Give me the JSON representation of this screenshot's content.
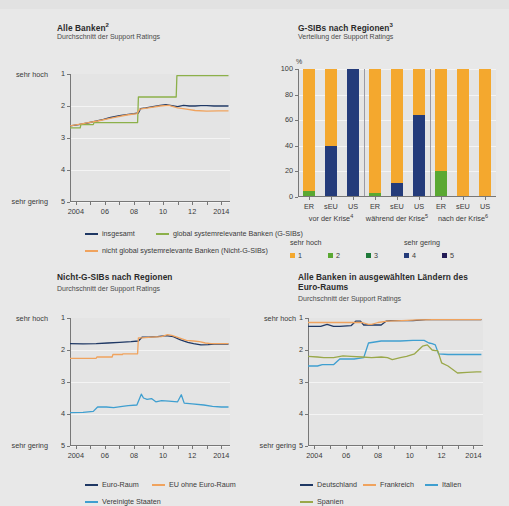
{
  "figure": {
    "background": "#e8e8e8",
    "palette": {
      "navy": "#1f3864",
      "green": "#8cb04a",
      "orange_line": "#f0a35e",
      "blue_light": "#3f9fd0",
      "olive": "#9aa84a",
      "bar_orange": "#f4a82e",
      "bar_green_light": "#5aa832",
      "bar_green_dark": "#1f7a3a",
      "bar_blue": "#243b7a",
      "bar_navy": "#221a55"
    }
  },
  "panel1": {
    "title": "Alle Banken",
    "title_sup": "2",
    "subtitle": "Durchschnitt der Support Ratings",
    "axis": {
      "y_top_label": "sehr hoch",
      "y_bottom_label": "sehr gering",
      "y_ticks": [
        "1",
        "2",
        "3",
        "4",
        "5"
      ],
      "x_ticks": [
        "2004",
        "06",
        "08",
        "10",
        "12",
        "2014"
      ]
    },
    "legend": [
      {
        "label": "insgesamt",
        "color": "#1f3864"
      },
      {
        "label": "global systemrelevante Banken (G-SIBs)",
        "color": "#8cb04a"
      },
      {
        "label": "nicht global systemrelevante Banken (Nicht-G-SIBs)",
        "color": "#f0a35e"
      }
    ]
  },
  "panel2": {
    "title": "G-SIBs nach Regionen",
    "title_sup": "3",
    "subtitle": "Verteilung der Support Ratings",
    "axis": {
      "unit": "%",
      "y_ticks": [
        "100",
        "80",
        "60",
        "40",
        "20",
        "0"
      ],
      "group_labels": [
        "ER",
        "sEU",
        "US",
        "ER",
        "sEU",
        "US",
        "ER",
        "sEU",
        "US"
      ],
      "period_labels": [
        {
          "text": "vor der Krise",
          "sup": "4"
        },
        {
          "text": "während der Krise",
          "sup": "5"
        },
        {
          "text": "nach der Krise",
          "sup": "6"
        }
      ]
    },
    "legend_heads": {
      "left": "sehr hoch",
      "right": "sehr gering"
    },
    "legend": [
      {
        "label": "1",
        "color": "#f4a82e"
      },
      {
        "label": "2",
        "color": "#5aa832"
      },
      {
        "label": "3",
        "color": "#1f7a3a"
      },
      {
        "label": "4",
        "color": "#243b7a"
      },
      {
        "label": "5",
        "color": "#221a55"
      }
    ]
  },
  "panel3": {
    "title": "Nicht-G-SIBs nach Regionen",
    "title_sup": "",
    "subtitle": "Durchschnitt der Support Ratings",
    "axis": {
      "y_top_label": "sehr hoch",
      "y_bottom_label": "sehr gering",
      "y_ticks": [
        "1",
        "2",
        "3",
        "4",
        "5"
      ],
      "x_ticks": [
        "2004",
        "06",
        "08",
        "10",
        "12",
        "2014"
      ]
    },
    "legend": [
      {
        "label": "Euro-Raum",
        "color": "#1f3864"
      },
      {
        "label": "EU ohne Euro-Raum",
        "color": "#f0a35e"
      },
      {
        "label": "Vereinigte Staaten",
        "color": "#3f9fd0"
      }
    ]
  },
  "panel4": {
    "title": "Alle Banken in ausgewählten Ländern des Euro-Raums",
    "title_sup": "",
    "subtitle": "Durchschnitt der Support Ratings",
    "axis": {
      "y_top_label": "sehr hoch",
      "y_bottom_label": "sehr gering",
      "y_ticks": [
        "1",
        "2",
        "3",
        "4",
        "5"
      ],
      "x_ticks": [
        "2004",
        "06",
        "08",
        "10",
        "12",
        "2014"
      ]
    },
    "legend": [
      {
        "label": "Deutschland",
        "color": "#1f3864"
      },
      {
        "label": "Frankreich",
        "color": "#f0a35e"
      },
      {
        "label": "Italien",
        "color": "#3f9fd0"
      },
      {
        "label": "Spanien",
        "color": "#9aa84a"
      }
    ]
  },
  "chart_data": [
    {
      "id": "panel1",
      "type": "line",
      "title": "Alle Banken² — Durchschnitt der Support Ratings",
      "xlabel": "",
      "ylabel": "Support Rating",
      "ylim": [
        1,
        5
      ],
      "y_inverted": true,
      "xlim": [
        2003.6,
        2014.6
      ],
      "grid": true,
      "legend_position": "below",
      "series": [
        {
          "name": "insgesamt",
          "color": "#1f3864",
          "x": [
            2003.6,
            2004.2,
            2004.8,
            2005.3,
            2005.9,
            2006.4,
            2007.0,
            2007.6,
            2008.0,
            2008.3,
            2008.45,
            2008.8,
            2009.3,
            2009.8,
            2010.2,
            2010.6,
            2011.0,
            2011.4,
            2011.8,
            2012.2,
            2012.6,
            2013.0,
            2013.5,
            2014.0,
            2014.5
          ],
          "y": [
            2.62,
            2.58,
            2.53,
            2.48,
            2.42,
            2.36,
            2.3,
            2.26,
            2.24,
            2.22,
            2.08,
            2.06,
            2.02,
            1.98,
            1.96,
            1.99,
            2.02,
            1.98,
            2.0,
            2.0,
            1.99,
            1.99,
            2.0,
            2.0,
            2.0
          ]
        },
        {
          "name": "global systemrelevante Banken (G-SIBs)",
          "color": "#8cb04a",
          "x": [
            2003.6,
            2004.3,
            2004.35,
            2005.2,
            2005.25,
            2006.1,
            2006.15,
            2007.0,
            2007.05,
            2008.25,
            2008.3,
            2010.9,
            2010.95,
            2014.5
          ],
          "y": [
            2.68,
            2.68,
            2.58,
            2.58,
            2.52,
            2.52,
            2.52,
            2.52,
            2.52,
            2.52,
            1.72,
            1.72,
            1.05,
            1.05
          ]
        },
        {
          "name": "nicht global systemrelevante Banken (Nicht-G-SIBs)",
          "color": "#f0a35e",
          "x": [
            2003.6,
            2004.5,
            2005.5,
            2006.5,
            2007.5,
            2008.2,
            2008.4,
            2009.0,
            2009.8,
            2010.4,
            2011.0,
            2011.6,
            2012.2,
            2013.0,
            2013.8,
            2014.5
          ],
          "y": [
            2.62,
            2.55,
            2.47,
            2.37,
            2.28,
            2.24,
            2.1,
            2.06,
            2.0,
            1.98,
            2.06,
            2.1,
            2.14,
            2.16,
            2.15,
            2.15
          ]
        }
      ]
    },
    {
      "id": "panel2",
      "type": "bar",
      "title": "G-SIBs nach Regionen³ — Verteilung der Support Ratings",
      "subtitle": "Verteilung der Support Ratings",
      "unit": "%",
      "ylim": [
        0,
        100
      ],
      "ylabel": "%",
      "grid": true,
      "stacked": true,
      "categories": [
        "ER",
        "sEU",
        "US",
        "ER",
        "sEU",
        "US",
        "ER",
        "sEU",
        "US"
      ],
      "groups": [
        "vor der Krise⁴",
        "während der Krise⁵",
        "nach der Krise⁶"
      ],
      "series": [
        {
          "name": "1",
          "color": "#f4a82e",
          "values": [
            95,
            60,
            0,
            97,
            89,
            36,
            80,
            100,
            100
          ]
        },
        {
          "name": "2",
          "color": "#5aa832",
          "values": [
            5,
            0,
            0,
            3,
            0,
            0,
            20,
            0,
            0
          ]
        },
        {
          "name": "3",
          "color": "#1f7a3a",
          "values": [
            0,
            0,
            0,
            0,
            0,
            0,
            0,
            0,
            0
          ]
        },
        {
          "name": "4",
          "color": "#243b7a",
          "values": [
            0,
            40,
            100,
            0,
            11,
            64,
            0,
            0,
            0
          ]
        },
        {
          "name": "5",
          "color": "#221a55",
          "values": [
            0,
            0,
            0,
            0,
            0,
            0,
            0,
            0,
            0
          ]
        }
      ]
    },
    {
      "id": "panel3",
      "type": "line",
      "title": "Nicht-G-SIBs nach Regionen — Durchschnitt der Support Ratings",
      "ylim": [
        1,
        5
      ],
      "y_inverted": true,
      "xlim": [
        2003.6,
        2014.6
      ],
      "grid": true,
      "series": [
        {
          "name": "Euro-Raum",
          "color": "#1f3864",
          "x": [
            2003.6,
            2004.5,
            2005.4,
            2006.2,
            2007.0,
            2007.8,
            2008.3,
            2008.55,
            2009.0,
            2009.6,
            2010.2,
            2010.7,
            2011.2,
            2011.7,
            2012.1,
            2012.6,
            2013.1,
            2013.5,
            2014.0,
            2014.5
          ],
          "y": [
            1.8,
            1.81,
            1.8,
            1.78,
            1.76,
            1.74,
            1.72,
            1.6,
            1.6,
            1.58,
            1.55,
            1.58,
            1.68,
            1.76,
            1.8,
            1.84,
            1.83,
            1.82,
            1.82,
            1.82
          ]
        },
        {
          "name": "EU ohne Euro-Raum",
          "color": "#f0a35e",
          "x": [
            2003.6,
            2005.4,
            2005.45,
            2006.5,
            2006.55,
            2007.2,
            2007.25,
            2008.25,
            2008.3,
            2008.55,
            2009.2,
            2009.9,
            2010.3,
            2010.6,
            2011.1,
            2011.6,
            2012.1,
            2012.5,
            2012.9,
            2013.3,
            2014.0,
            2014.5
          ],
          "y": [
            2.26,
            2.26,
            2.22,
            2.22,
            2.14,
            2.14,
            2.12,
            2.12,
            1.62,
            1.62,
            1.6,
            1.58,
            1.52,
            1.54,
            1.62,
            1.7,
            1.72,
            1.74,
            1.78,
            1.8,
            1.8,
            1.8
          ]
        },
        {
          "name": "Vereinigte Staaten",
          "color": "#3f9fd0",
          "x": [
            2003.6,
            2004.5,
            2005.2,
            2005.5,
            2006.1,
            2006.6,
            2007.2,
            2007.6,
            2008.2,
            2008.5,
            2008.65,
            2008.9,
            2009.2,
            2009.5,
            2009.9,
            2010.4,
            2011.0,
            2011.25,
            2011.45,
            2012.0,
            2012.8,
            2013.4,
            2014.0,
            2014.5
          ],
          "y": [
            3.96,
            3.95,
            3.92,
            3.78,
            3.78,
            3.8,
            3.76,
            3.74,
            3.72,
            3.38,
            3.5,
            3.54,
            3.52,
            3.62,
            3.58,
            3.6,
            3.62,
            3.4,
            3.66,
            3.68,
            3.72,
            3.76,
            3.78,
            3.78
          ]
        }
      ]
    },
    {
      "id": "panel4",
      "type": "line",
      "title": "Alle Banken in ausgewählten Ländern des Euro-Raums — Durchschnitt der Support Ratings",
      "ylim": [
        1,
        5
      ],
      "y_inverted": true,
      "xlim": [
        2003.6,
        2014.6
      ],
      "grid": true,
      "series": [
        {
          "name": "Deutschland",
          "color": "#1f3864",
          "x": [
            2003.6,
            2004.4,
            2004.8,
            2005.2,
            2005.6,
            2006.3,
            2006.6,
            2006.9,
            2007.1,
            2007.5,
            2008.2,
            2008.5,
            2008.8,
            2009.5,
            2010.2,
            2011.0,
            2011.6,
            2012.5,
            2013.5,
            2014.5
          ],
          "y": [
            1.26,
            1.26,
            1.2,
            1.26,
            1.26,
            1.24,
            1.1,
            1.1,
            1.22,
            1.22,
            1.22,
            1.1,
            1.08,
            1.08,
            1.08,
            1.05,
            1.05,
            1.05,
            1.05,
            1.05
          ]
        },
        {
          "name": "Frankreich",
          "color": "#f0a35e",
          "x": [
            2003.6,
            2005.0,
            2006.0,
            2007.0,
            2007.4,
            2007.6,
            2008.0,
            2008.6,
            2009.5,
            2010.5,
            2011.5,
            2012.5,
            2013.5,
            2014.5
          ],
          "y": [
            1.14,
            1.14,
            1.14,
            1.14,
            1.2,
            1.2,
            1.14,
            1.1,
            1.08,
            1.06,
            1.05,
            1.05,
            1.05,
            1.05
          ]
        },
        {
          "name": "Italien",
          "color": "#3f9fd0",
          "x": [
            2003.6,
            2004.2,
            2004.5,
            2005.2,
            2005.6,
            2006.2,
            2006.5,
            2006.8,
            2007.1,
            2007.4,
            2008.2,
            2008.6,
            2009.4,
            2010.2,
            2010.9,
            2011.2,
            2011.4,
            2011.6,
            2011.8,
            2012.4,
            2013.2,
            2014.0,
            2014.5
          ],
          "y": [
            2.5,
            2.5,
            2.46,
            2.46,
            2.28,
            2.28,
            2.28,
            2.26,
            2.24,
            1.78,
            1.72,
            1.72,
            1.72,
            1.7,
            1.7,
            1.78,
            1.8,
            1.84,
            2.12,
            2.14,
            2.14,
            2.14,
            2.14
          ]
        },
        {
          "name": "Spanien",
          "color": "#9aa84a",
          "x": [
            2003.6,
            2004.2,
            2004.6,
            2005.2,
            2005.8,
            2006.3,
            2007.0,
            2007.6,
            2008.2,
            2008.6,
            2008.9,
            2009.4,
            2009.8,
            2010.3,
            2010.8,
            2011.1,
            2011.4,
            2011.6,
            2011.75,
            2012.0,
            2012.4,
            2013.0,
            2013.6,
            2014.2,
            2014.5
          ],
          "y": [
            2.2,
            2.22,
            2.24,
            2.24,
            2.18,
            2.2,
            2.22,
            2.24,
            2.22,
            2.24,
            2.3,
            2.24,
            2.2,
            2.12,
            1.88,
            1.84,
            2.0,
            2.02,
            2.02,
            2.4,
            2.5,
            2.72,
            2.7,
            2.68,
            2.68
          ]
        }
      ]
    }
  ]
}
